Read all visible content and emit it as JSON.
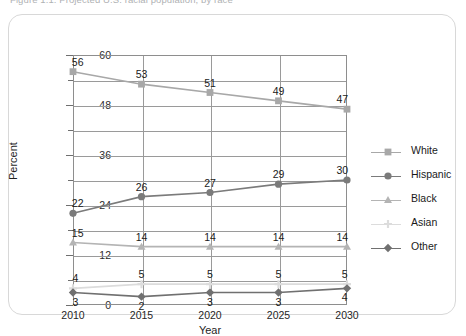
{
  "figure": {
    "caption": "Figure 1.1. Projected U.S. racial population, by race",
    "card_border_color": "#d8d8d8"
  },
  "chart_data": {
    "type": "line",
    "title": "",
    "xlabel": "Year",
    "ylabel": "Percent",
    "categories": [
      "2010",
      "2015",
      "2020",
      "2025",
      "2030"
    ],
    "x": [
      2010,
      2015,
      2020,
      2025,
      2030
    ],
    "ylim": [
      0,
      60
    ],
    "yticks": [
      0,
      12,
      24,
      36,
      48,
      60
    ],
    "yticks_minor": [
      6,
      18,
      30,
      42,
      54
    ],
    "gridlines": [
      0,
      6,
      12,
      18,
      24,
      30,
      36,
      42,
      48,
      54,
      60
    ],
    "grid": true,
    "legend_position": "right",
    "series": [
      {
        "name": "White",
        "values": [
          56,
          53,
          51,
          49,
          47
        ],
        "color": "#a8a8a8",
        "marker": "square",
        "label_side": "above"
      },
      {
        "name": "Hispanic",
        "values": [
          22,
          26,
          27,
          29,
          30
        ],
        "color": "#7b7b7b",
        "marker": "circle",
        "label_side": "above"
      },
      {
        "name": "Black",
        "values": [
          15,
          14,
          14,
          14,
          14
        ],
        "color": "#b4b4b4",
        "marker": "triangle",
        "label_side": "above"
      },
      {
        "name": "Asian",
        "values": [
          4,
          5,
          5,
          5,
          5
        ],
        "color": "#dcdcdc",
        "marker": "plus",
        "label_side": "above"
      },
      {
        "name": "Other",
        "values": [
          3,
          2,
          3,
          3,
          4
        ],
        "color": "#707070",
        "marker": "diamond",
        "label_side": "below"
      }
    ]
  },
  "legend": {
    "items": [
      {
        "label": "White",
        "marker": "square",
        "color": "#a8a8a8"
      },
      {
        "label": "Hispanic",
        "marker": "circle",
        "color": "#7b7b7b"
      },
      {
        "label": "Black",
        "marker": "triangle",
        "color": "#b4b4b4"
      },
      {
        "label": "Asian",
        "marker": "plus",
        "color": "#dcdcdc"
      },
      {
        "label": "Other",
        "marker": "diamond",
        "color": "#707070"
      }
    ]
  }
}
